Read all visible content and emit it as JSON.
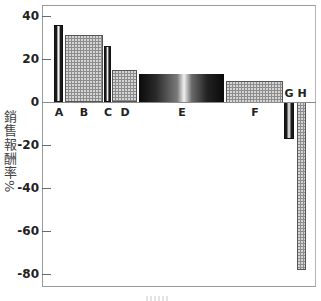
{
  "chart_data": {
    "type": "bar",
    "title": "",
    "xlabel": "",
    "ylabel": "銷售報酬率%",
    "categories": [
      "A",
      "B",
      "C",
      "D",
      "E",
      "F",
      "G",
      "H"
    ],
    "values": [
      36,
      31,
      26,
      15,
      13,
      10,
      -17,
      -78
    ],
    "bar_x_px": [
      [
        54,
        63
      ],
      [
        65,
        103
      ],
      [
        104,
        111
      ],
      [
        112,
        137
      ],
      [
        139,
        224
      ],
      [
        226,
        283
      ],
      [
        284,
        294
      ],
      [
        297,
        306
      ]
    ],
    "bar_styles": [
      "striped",
      "dotted",
      "striped",
      "dotted",
      "gradient",
      "dotted",
      "striped",
      "dotted"
    ],
    "ylim": [
      -85,
      45
    ],
    "yticks": [
      40,
      20,
      0,
      -20,
      -40,
      -60,
      -80
    ],
    "ytick_labels": [
      "40",
      "20",
      "0",
      "-20",
      "-40",
      "-60",
      "-80"
    ],
    "grid": false,
    "legend": null,
    "zero_line": true,
    "note": "variable-width bars (Marimekko style); x-axis label cropped and illegible"
  },
  "labels": {
    "y_axis": "銷售報酬率%"
  }
}
